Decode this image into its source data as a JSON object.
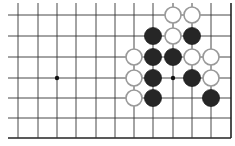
{
  "board": {
    "description": "Go board fragment (top-right area)",
    "line_color": "#333333",
    "edge_color": "#222222",
    "black_stone_color": "#262626",
    "white_stone_fill": "#ffffff",
    "white_stone_stroke": "#999999",
    "columns_x": [
      18,
      38,
      57,
      76,
      96,
      115,
      134,
      153,
      173,
      192,
      211,
      231
    ],
    "rows_y": [
      15,
      36,
      57,
      78,
      98,
      118,
      138
    ],
    "top_open_to": 3,
    "left_open_to": 8,
    "right_edge_col": 11,
    "bottom_edge_row": 6,
    "star_points": [
      {
        "col": 2,
        "row": 3
      },
      {
        "col": 8,
        "row": 3
      }
    ],
    "stones": [
      {
        "color": "white",
        "col": 8,
        "row": 0
      },
      {
        "color": "white",
        "col": 9,
        "row": 0
      },
      {
        "color": "black",
        "col": 7,
        "row": 1
      },
      {
        "color": "white",
        "col": 8,
        "row": 1
      },
      {
        "color": "black",
        "col": 9,
        "row": 1
      },
      {
        "color": "white",
        "col": 6,
        "row": 2
      },
      {
        "color": "black",
        "col": 7,
        "row": 2
      },
      {
        "color": "black",
        "col": 8,
        "row": 2
      },
      {
        "color": "white",
        "col": 9,
        "row": 2
      },
      {
        "color": "white",
        "col": 10,
        "row": 2
      },
      {
        "color": "white",
        "col": 6,
        "row": 3
      },
      {
        "color": "black",
        "col": 7,
        "row": 3
      },
      {
        "color": "black",
        "col": 9,
        "row": 3
      },
      {
        "color": "white",
        "col": 10,
        "row": 3
      },
      {
        "color": "white",
        "col": 6,
        "row": 4
      },
      {
        "color": "black",
        "col": 7,
        "row": 4
      },
      {
        "color": "black",
        "col": 10,
        "row": 4
      }
    ]
  }
}
